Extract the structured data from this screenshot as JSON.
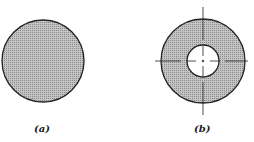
{
  "figure": {
    "panels": [
      {
        "label": "(a)",
        "shape": "solid-circle"
      },
      {
        "label": "(b)",
        "shape": "annulus-with-centerlines"
      }
    ],
    "colors": {
      "fill": "#b5b5b5",
      "stroke": "#222222",
      "background": "#ffffff"
    }
  }
}
